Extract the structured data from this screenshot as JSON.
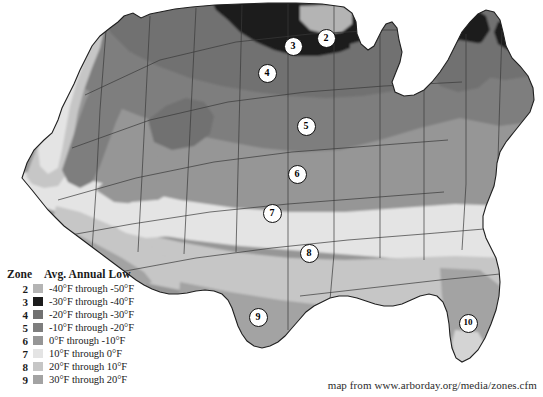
{
  "legend": {
    "header_zone": "Zone",
    "header_low": "Avg. Annual Low",
    "rows": [
      {
        "zone": "2",
        "label": "-40°F through -50°F",
        "color": "#b4b4b4"
      },
      {
        "zone": "3",
        "label": "-30°F through -40°F",
        "color": "#1c1c1c"
      },
      {
        "zone": "4",
        "label": "-20°F through -30°F",
        "color": "#717171"
      },
      {
        "zone": "5",
        "label": "-10°F through -20°F",
        "color": "#7e7e7e"
      },
      {
        "zone": "6",
        "label": "0°F through -10°F",
        "color": "#969696"
      },
      {
        "zone": "7",
        "label": "10°F through 0°F",
        "color": "#e4e4e4"
      },
      {
        "zone": "8",
        "label": "20°F through 10°F",
        "color": "#c6c6c6"
      },
      {
        "zone": "9",
        "label": "30°F through 20°F",
        "color": "#a3a3a3"
      }
    ]
  },
  "markers": [
    {
      "zone": "2",
      "x": 325,
      "y": 37
    },
    {
      "zone": "3",
      "x": 292,
      "y": 45
    },
    {
      "zone": "4",
      "x": 266,
      "y": 72
    },
    {
      "zone": "5",
      "x": 305,
      "y": 125
    },
    {
      "zone": "6",
      "x": 296,
      "y": 173
    },
    {
      "zone": "7",
      "x": 271,
      "y": 212
    },
    {
      "zone": "8",
      "x": 308,
      "y": 252
    },
    {
      "zone": "9",
      "x": 257,
      "y": 316
    },
    {
      "zone": "10",
      "x": 467,
      "y": 322
    }
  ],
  "attribution": "map from www.arborday.org/media/zones.cfm",
  "colors": {
    "background": "#ffffff",
    "outline": "#1f1f1f",
    "state_border": "#3a3a3a",
    "text": "#1a1a1a"
  },
  "map": {
    "name": "united-states-hardiness-zones",
    "projection_note": "contiguous United States"
  }
}
